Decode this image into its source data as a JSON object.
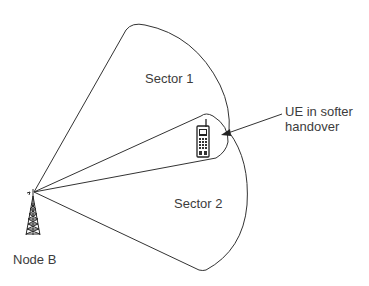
{
  "diagram": {
    "type": "softer-handover-sectors",
    "base_station": {
      "label": "Node B",
      "icon": "antenna-tower-icon"
    },
    "sectors": [
      {
        "id": "sector-1",
        "label": "Sector 1"
      },
      {
        "id": "sector-2",
        "label": "Sector 2"
      }
    ],
    "ue": {
      "icon": "mobile-phone-icon",
      "annotation_line1": "UE in softer",
      "annotation_line2": "handover"
    },
    "colors": {
      "stroke": "#333333",
      "text": "#3c3c3c",
      "background": "#ffffff"
    }
  }
}
